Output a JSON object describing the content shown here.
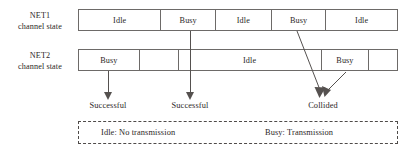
{
  "figure": {
    "rows": [
      {
        "id": "net1",
        "label_line1": "NET1",
        "label_line2": "channel state",
        "segments": [
          {
            "label": "Idle",
            "width_pct": 25.9
          },
          {
            "label": "Busy",
            "width_pct": 17.2
          },
          {
            "label": "Idle",
            "width_pct": 17.5
          },
          {
            "label": "Busy",
            "width_pct": 17.2
          },
          {
            "label": "Idle",
            "width_pct": 22.2
          }
        ]
      },
      {
        "id": "net2",
        "label_line1": "NET2",
        "label_line2": "channel state",
        "segments": [
          {
            "label": "Busy",
            "width_pct": 19.1
          },
          {
            "label": "",
            "width_pct": 12.2
          },
          {
            "label": "Idle",
            "width_pct": 45.0
          },
          {
            "label": "Busy",
            "width_pct": 15.0
          },
          {
            "label": "",
            "width_pct": 8.7
          }
        ]
      }
    ],
    "outcomes": [
      {
        "id": "outcome-1",
        "label": "Successful",
        "x": 108
      },
      {
        "id": "outcome-2",
        "label": "Successful",
        "x": 190
      },
      {
        "id": "outcome-3",
        "label": "Collided",
        "x": 323
      }
    ],
    "legend": {
      "idle": "Idle: No transmission",
      "busy": "Busy: Transmission"
    },
    "colors": {
      "stroke": "#6d6a68",
      "arrow": "#55514f",
      "text": "#2b2726",
      "background": "#ffffff",
      "legend_border": "#4f4b49"
    }
  }
}
